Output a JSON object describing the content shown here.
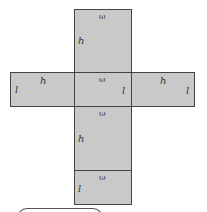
{
  "diagram": {
    "type": "box net (unfolded rectangular prism)",
    "fill_color": "#c9c9c9",
    "stroke_color": "#444444",
    "faces": [
      {
        "id": "top",
        "labels": {
          "width": "ω",
          "height": "h"
        }
      },
      {
        "id": "left",
        "labels": {
          "length": "l",
          "height": "h"
        }
      },
      {
        "id": "center",
        "labels": {
          "width": "ω",
          "length": "l"
        }
      },
      {
        "id": "right",
        "labels": {
          "height": "h",
          "length": "l"
        }
      },
      {
        "id": "lower",
        "labels": {
          "width": "ω",
          "height": "h"
        }
      },
      {
        "id": "bottom",
        "labels": {
          "width": "ω",
          "length": "l"
        }
      }
    ]
  }
}
